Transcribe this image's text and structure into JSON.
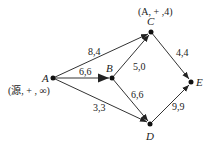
{
  "diagram": {
    "type": "network-flow",
    "nodes": [
      {
        "id": "A",
        "label": "A",
        "x": 53,
        "y": 78,
        "annotation": "(源, + , ∞)"
      },
      {
        "id": "B",
        "label": "B",
        "x": 112,
        "y": 78,
        "annotation": ""
      },
      {
        "id": "C",
        "label": "C",
        "x": 151,
        "y": 32,
        "annotation": "(A, + ,4)"
      },
      {
        "id": "D",
        "label": "D",
        "x": 150,
        "y": 124,
        "annotation": ""
      },
      {
        "id": "E",
        "label": "E",
        "x": 191,
        "y": 82,
        "annotation": ""
      }
    ],
    "edges": [
      {
        "from": "A",
        "to": "C",
        "label": "8,4"
      },
      {
        "from": "A",
        "to": "B",
        "label": "6,6"
      },
      {
        "from": "B",
        "to": "C",
        "label": "5,0"
      },
      {
        "from": "A",
        "to": "D",
        "label": "3,3"
      },
      {
        "from": "B",
        "to": "D",
        "label": "6,6"
      },
      {
        "from": "C",
        "to": "E",
        "label": "4,4"
      },
      {
        "from": "D",
        "to": "E",
        "label": "9,9"
      }
    ]
  }
}
